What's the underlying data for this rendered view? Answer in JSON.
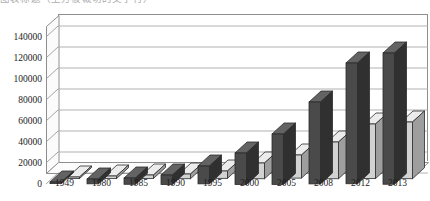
{
  "caption": {
    "sliver_text": "图表标题（上方被裁切的文字行）"
  },
  "chart_data": {
    "type": "bar",
    "title": "",
    "subtitle": "",
    "xlabel": "",
    "ylabel": "",
    "categories": [
      "1949",
      "1980",
      "1985",
      "1990",
      "1995",
      "2000",
      "2005",
      "2008",
      "2012",
      "2013"
    ],
    "series": [
      {
        "name": "series-1",
        "color": "#4a4a4a",
        "values": [
          300,
          4600,
          6000,
          9000,
          17000,
          30000,
          48000,
          78000,
          115000,
          125000
        ]
      },
      {
        "name": "series-2",
        "color": "#d2d2d2",
        "values": [
          100,
          2500,
          3300,
          4500,
          7000,
          15000,
          22000,
          35000,
          52000,
          54000
        ]
      }
    ],
    "ylim": [
      0,
      140000
    ],
    "ytick_step": 20000,
    "yticks": [
      "0",
      "20000",
      "40000",
      "60000",
      "80000",
      "100000",
      "120000",
      "140000"
    ],
    "grid": true,
    "grid_axis": "y",
    "legend": false,
    "legend_position": "none",
    "three_d": true,
    "plot_bgcolor": "#ffffff",
    "axis_color": "#8e8e8e",
    "gridline_color": "#a8a8a8"
  }
}
